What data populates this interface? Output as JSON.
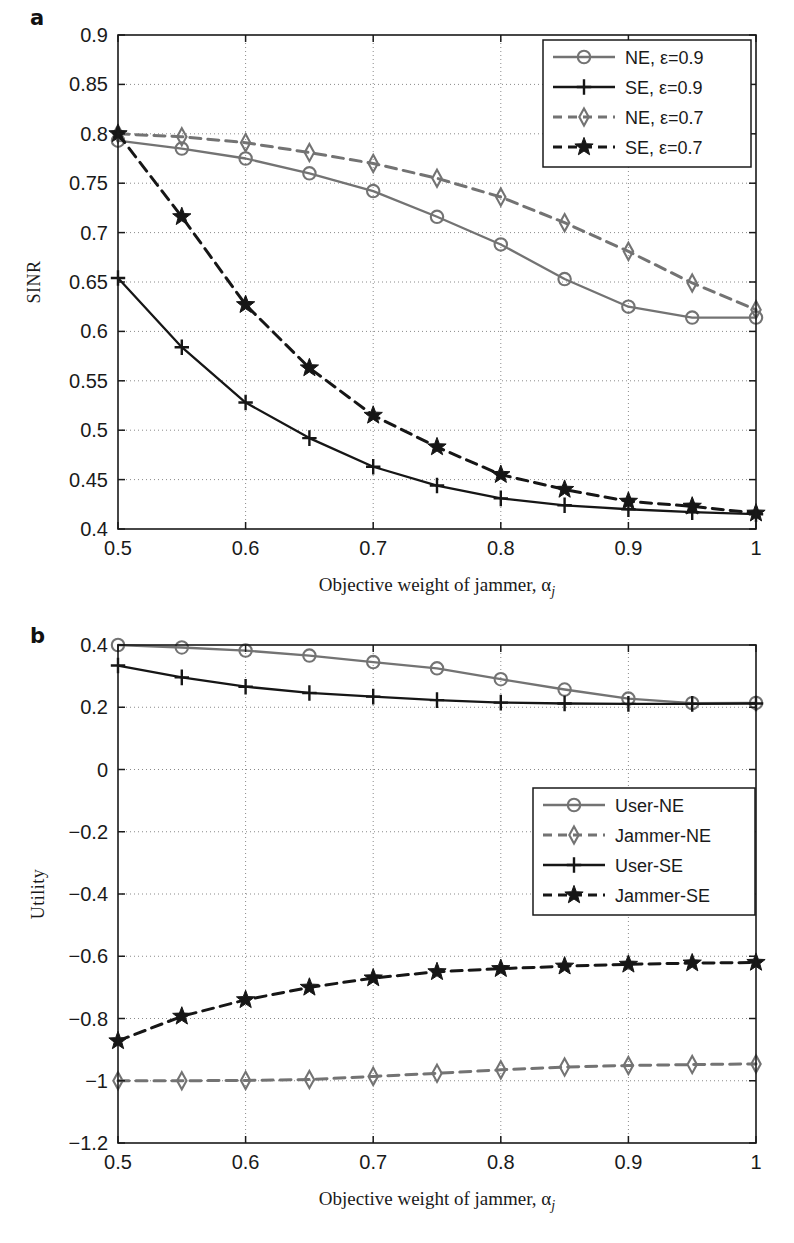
{
  "figure": {
    "background": "#ffffff",
    "panels": [
      {
        "letter": "a"
      },
      {
        "letter": "b"
      }
    ]
  },
  "colors": {
    "ne_gray": "#737373",
    "se_black": "#161616",
    "axis": "#1a1a1a",
    "grid": "#8a8a8a",
    "text": "#1a1a1a"
  },
  "chart_data": [
    {
      "id": "panel-a",
      "panel_letter": "a",
      "type": "line",
      "title": "",
      "xlabel": "Objective weight of jammer, α",
      "xlabel_sub": "j",
      "ylabel": "SINR",
      "xlim": [
        0.5,
        1.0
      ],
      "ylim": [
        0.4,
        0.9
      ],
      "xticks": [
        0.5,
        0.6,
        0.7,
        0.8,
        0.9,
        1
      ],
      "xticklabels": [
        "0.5",
        "0.6",
        "0.7",
        "0.8",
        "0.9",
        "1"
      ],
      "yticks": [
        0.4,
        0.45,
        0.5,
        0.55,
        0.6,
        0.65,
        0.7,
        0.75,
        0.8,
        0.85,
        0.9
      ],
      "yticklabels": [
        "0.4",
        "0.45",
        "0.5",
        "0.55",
        "0.6",
        "0.65",
        "0.7",
        "0.75",
        "0.8",
        "0.85",
        "0.9"
      ],
      "grid": true,
      "legend_position": "top-right",
      "x": [
        0.5,
        0.55,
        0.6,
        0.65,
        0.7,
        0.75,
        0.8,
        0.85,
        0.9,
        0.95,
        1.0
      ],
      "series": [
        {
          "name": "NE, ε=0.9",
          "color": "#737373",
          "dash": "solid",
          "marker": "circle",
          "values": [
            0.793,
            0.785,
            0.775,
            0.76,
            0.742,
            0.716,
            0.688,
            0.653,
            0.625,
            0.614,
            0.614
          ]
        },
        {
          "name": "SE, ε=0.9",
          "color": "#161616",
          "dash": "solid",
          "marker": "plus",
          "values": [
            0.654,
            0.584,
            0.528,
            0.492,
            0.463,
            0.444,
            0.431,
            0.424,
            0.42,
            0.417,
            0.415
          ]
        },
        {
          "name": "NE, ε=0.7",
          "color": "#737373",
          "dash": "dashed",
          "marker": "diamond",
          "values": [
            0.8,
            0.797,
            0.791,
            0.781,
            0.77,
            0.755,
            0.736,
            0.71,
            0.681,
            0.649,
            0.622
          ]
        },
        {
          "name": "SE, ε=0.7",
          "color": "#161616",
          "dash": "dashed",
          "marker": "star",
          "values": [
            0.8,
            0.716,
            0.627,
            0.563,
            0.515,
            0.483,
            0.455,
            0.44,
            0.428,
            0.423,
            0.416
          ]
        }
      ]
    },
    {
      "id": "panel-b",
      "panel_letter": "b",
      "type": "line",
      "title": "",
      "xlabel": "Objective weight of jammer, α",
      "xlabel_sub": "j",
      "ylabel": "Utility",
      "xlim": [
        0.5,
        1.0
      ],
      "ylim": [
        -1.2,
        0.4
      ],
      "xticks": [
        0.5,
        0.6,
        0.7,
        0.8,
        0.9,
        1
      ],
      "xticklabels": [
        "0.5",
        "0.6",
        "0.7",
        "0.8",
        "0.9",
        "1"
      ],
      "yticks": [
        -1.2,
        -1,
        -0.8,
        -0.6,
        -0.4,
        -0.2,
        0,
        0.2,
        0.4
      ],
      "yticklabels": [
        "−1.2",
        "−1",
        "−0.8",
        "−0.6",
        "−0.4",
        "−0.2",
        "0",
        "0.2",
        "0.4"
      ],
      "grid": true,
      "legend_position": "middle-right",
      "x": [
        0.5,
        0.55,
        0.6,
        0.65,
        0.7,
        0.75,
        0.8,
        0.85,
        0.9,
        0.95,
        1.0
      ],
      "series": [
        {
          "name": "User-NE",
          "color": "#737373",
          "dash": "solid",
          "marker": "circle",
          "values": [
            0.4,
            0.392,
            0.382,
            0.366,
            0.345,
            0.325,
            0.29,
            0.257,
            0.228,
            0.213,
            0.214
          ]
        },
        {
          "name": "Jammer-NE",
          "color": "#737373",
          "dash": "dashed",
          "marker": "diamond",
          "values": [
            -1.0,
            -1.0,
            -0.999,
            -0.996,
            -0.986,
            -0.976,
            -0.965,
            -0.956,
            -0.951,
            -0.948,
            -0.946
          ]
        },
        {
          "name": "User-SE",
          "color": "#161616",
          "dash": "solid",
          "marker": "plus",
          "values": [
            0.334,
            0.296,
            0.266,
            0.246,
            0.234,
            0.223,
            0.215,
            0.212,
            0.211,
            0.211,
            0.212
          ]
        },
        {
          "name": "Jammer-SE",
          "color": "#161616",
          "dash": "dashed",
          "marker": "star",
          "values": [
            -0.872,
            -0.793,
            -0.74,
            -0.7,
            -0.67,
            -0.65,
            -0.64,
            -0.632,
            -0.626,
            -0.622,
            -0.62
          ]
        }
      ]
    }
  ]
}
